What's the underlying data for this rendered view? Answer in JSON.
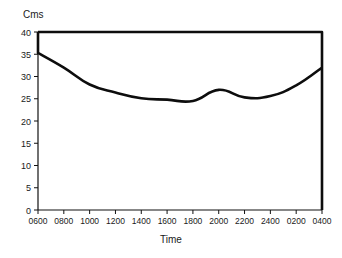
{
  "chart_data": {
    "type": "line",
    "title": "",
    "xlabel": "Time",
    "ylabel": "Cms",
    "ylim": [
      0,
      40
    ],
    "yticks": [
      0,
      5,
      10,
      15,
      20,
      25,
      30,
      35,
      40
    ],
    "ytick_labels": [
      "0",
      "5",
      "10",
      "15",
      "20",
      "25",
      "30",
      "35",
      "40"
    ],
    "grid": false,
    "legend": null,
    "categories": [
      "0600",
      "0800",
      "1000",
      "1200",
      "1400",
      "1600",
      "1800",
      "2000",
      "2200",
      "2400",
      "0200",
      "0400"
    ],
    "xtick_labels": [
      "0600",
      "0800",
      "1000",
      "1200",
      "1400",
      "1600",
      "1800",
      "2000",
      "2200",
      "2400",
      "0200",
      "0400"
    ],
    "series": [
      {
        "name": "Cms",
        "values": [
          35.3,
          32.0,
          28.2,
          26.4,
          25.1,
          24.8,
          24.5,
          27.0,
          25.3,
          25.6,
          28.0,
          32.0
        ]
      }
    ],
    "top_boundary_value": 40,
    "colors": {
      "line": "#0d0d0d",
      "axis": "#111111",
      "text": "#1a1a1a",
      "background": "#ffffff"
    }
  },
  "labels": {
    "y_axis_title": "Cms",
    "x_axis_title": "Time"
  }
}
